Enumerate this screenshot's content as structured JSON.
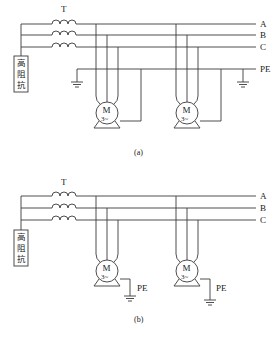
{
  "diagram_a": {
    "transformer_label": "T",
    "impedance_label": [
      "高",
      "阻",
      "抗"
    ],
    "bus_labels": [
      "A",
      "B",
      "C",
      "PE"
    ],
    "motor_label": "M",
    "motor_sub": "3~",
    "caption": "(a)"
  },
  "diagram_b": {
    "transformer_label": "T",
    "impedance_label": [
      "高",
      "阻",
      "抗"
    ],
    "bus_labels": [
      "A",
      "B",
      "C"
    ],
    "motor_label": "M",
    "motor_sub": "3~",
    "pe_label_1": "PE",
    "pe_label_2": "PE",
    "caption": "(b)"
  },
  "colors": {
    "line": "#3a3a3a",
    "background": "#ffffff"
  }
}
